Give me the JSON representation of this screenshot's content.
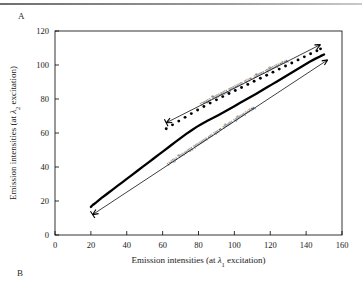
{
  "figure": {
    "panel_a_label": "A",
    "panel_b_label": "B"
  },
  "chart_data": {
    "type": "scatter",
    "title": "",
    "xlabel_parts": {
      "pre": "Emission intensities (at ",
      "sym": "λ",
      "sub": "1",
      "post": " excitation)"
    },
    "ylabel_parts": {
      "pre": "Emission intensities (at ",
      "sym": "λ",
      "sub": "2",
      "post": " excitation)"
    },
    "xlabel": "Emission intensities (at λ1 excitation)",
    "ylabel": "Emission intensities (at λ2 excitation)",
    "xlim": [
      0,
      160
    ],
    "ylim": [
      0,
      120
    ],
    "xticks": [
      0,
      20,
      40,
      60,
      80,
      100,
      120,
      140,
      160
    ],
    "yticks": [
      0,
      20,
      40,
      60,
      80,
      100,
      120
    ],
    "grid": false,
    "legend_position": "none",
    "series": [
      {
        "name": "Wavelength range with no internal filtering effect",
        "style": "solid-thick-line",
        "color": "#000000",
        "x": [
          20.0,
          20.6,
          21.2,
          22.0,
          23.0,
          24.5,
          26.0,
          28.0,
          30.0,
          32.5,
          35.0,
          37.5,
          40.0,
          43.0,
          46.0,
          49.0,
          52.0,
          55.0,
          58.0,
          61.0,
          64.0,
          67.0,
          70.0,
          73.0,
          76.0,
          79.0,
          82.0,
          85.0,
          88.0,
          91.0,
          94.0,
          97.0,
          100.0,
          103.0,
          106.0,
          109.0,
          112.0,
          115.0,
          118.0,
          121.0,
          124.0,
          127.0,
          130.0,
          133.0,
          136.0,
          139.0,
          142.0,
          145.0,
          148.0,
          150.0
        ],
        "y": [
          16.5,
          17.2,
          17.8,
          18.4,
          19.2,
          20.5,
          21.8,
          23.4,
          25.0,
          27.0,
          29.0,
          31.0,
          33.0,
          35.4,
          37.8,
          40.2,
          42.6,
          45.0,
          47.4,
          49.8,
          52.2,
          54.6,
          57.0,
          59.3,
          61.5,
          63.6,
          65.5,
          67.2,
          68.8,
          70.5,
          72.2,
          74.0,
          75.8,
          77.6,
          79.4,
          81.2,
          83.0,
          84.8,
          86.7,
          88.6,
          90.5,
          92.4,
          94.3,
          96.2,
          98.1,
          100.0,
          101.9,
          103.6,
          105.2,
          106.2
        ]
      },
      {
        "name": "Wavelength range with internal filtering effect",
        "style": "dotted-markers",
        "color": "#000000",
        "x": [
          62.0,
          65.5,
          69.0,
          72.5,
          76.0,
          79.5,
          83.0,
          86.5,
          90.0,
          93.5,
          97.0,
          100.5,
          104.0,
          107.5,
          111.0,
          114.5,
          118.0,
          121.5,
          125.0,
          128.5,
          132.0,
          135.5,
          139.0,
          142.5,
          146.0,
          148.0
        ],
        "y": [
          62.5,
          64.8,
          67.0,
          69.2,
          71.4,
          73.5,
          75.6,
          77.6,
          79.5,
          81.4,
          83.2,
          85.0,
          86.8,
          88.6,
          90.4,
          92.2,
          94.0,
          95.8,
          97.6,
          99.4,
          101.2,
          103.0,
          104.8,
          106.6,
          108.4,
          109.5
        ]
      }
    ],
    "annotations": [
      {
        "id": "internal-filtering",
        "text": "Wavelength range with internal filtering effect",
        "arrow_from": [
          148,
          112
        ],
        "arrow_to": [
          62,
          66
        ]
      },
      {
        "id": "no-internal-filtering",
        "text": "Wavelength range with no internal filtering effect",
        "arrow_from": [
          152,
          103
        ],
        "arrow_to": [
          21,
          12
        ]
      }
    ]
  }
}
